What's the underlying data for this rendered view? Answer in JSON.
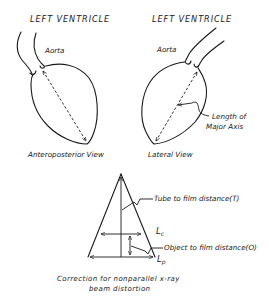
{
  "panels": {
    "anteroposterior": {
      "title": "LEFT VENTRICLE",
      "aorta_label": "Aorta",
      "view_label": "Anteroposterior View"
    },
    "lateral": {
      "title": "LEFT VENTRICLE",
      "aorta_label": "Aorta",
      "axis_label_line1": "Length of",
      "axis_label_line2": "Major Axis",
      "view_label": "Lateral View"
    }
  },
  "correction": {
    "tube_label": "Tube to film distance(T)",
    "lc_label": "L",
    "lc_sub": "c",
    "object_label": "Object to film distance(O)",
    "lp_label": "L",
    "lp_sub": "p",
    "caption_line1": "Correction for  nonparallel x-ray",
    "caption_line2": "beam distortion"
  },
  "colors": {
    "ink": "#1a1a1a",
    "background": "#ffffff"
  }
}
